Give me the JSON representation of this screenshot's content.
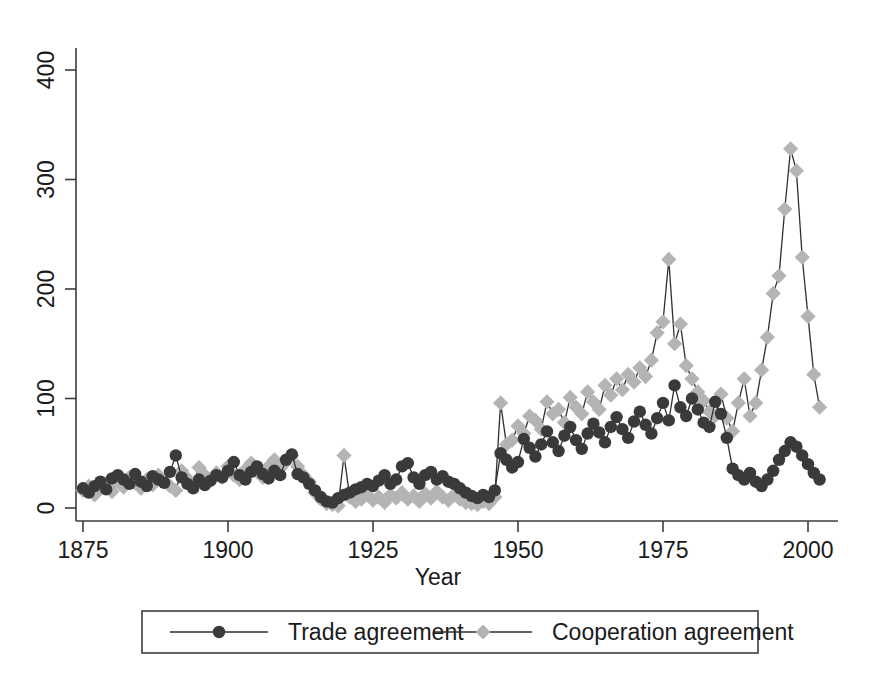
{
  "chart_data": {
    "type": "line",
    "title": "",
    "subtitle": "",
    "xlabel": "Year",
    "ylabel": "",
    "xlim": [
      1873,
      2004
    ],
    "ylim": [
      0,
      420
    ],
    "xticks": [
      1875,
      1900,
      1925,
      1950,
      1975,
      2000
    ],
    "xtick_labels": [
      "1875",
      "1900",
      "1925",
      "1950",
      "1975",
      "2000"
    ],
    "yticks": [
      0,
      100,
      200,
      300,
      400
    ],
    "ytick_labels": [
      "0",
      "100",
      "200",
      "300",
      "400"
    ],
    "grid": false,
    "legend_position": "bottom-outside",
    "colors": {
      "trade_marker": "#3a3a3a",
      "cooperation_marker": "#b4b4b4",
      "line": "#2f2f2f",
      "axis": "#3c3c3c",
      "background": "#ffffff",
      "text": "#1a1a1a"
    },
    "markers": {
      "trade": "circle",
      "cooperation": "diamond"
    },
    "x": [
      1875,
      1876,
      1877,
      1878,
      1879,
      1880,
      1881,
      1882,
      1883,
      1884,
      1885,
      1886,
      1887,
      1888,
      1889,
      1890,
      1891,
      1892,
      1893,
      1894,
      1895,
      1896,
      1897,
      1898,
      1899,
      1900,
      1901,
      1902,
      1903,
      1904,
      1905,
      1906,
      1907,
      1908,
      1909,
      1910,
      1911,
      1912,
      1913,
      1914,
      1915,
      1916,
      1917,
      1918,
      1919,
      1920,
      1921,
      1922,
      1923,
      1924,
      1925,
      1926,
      1927,
      1928,
      1929,
      1930,
      1931,
      1932,
      1933,
      1934,
      1935,
      1936,
      1937,
      1938,
      1939,
      1940,
      1941,
      1942,
      1943,
      1944,
      1945,
      1946,
      1947,
      1948,
      1949,
      1950,
      1951,
      1952,
      1953,
      1954,
      1955,
      1956,
      1957,
      1958,
      1959,
      1960,
      1961,
      1962,
      1963,
      1964,
      1965,
      1966,
      1967,
      1968,
      1969,
      1970,
      1971,
      1972,
      1973,
      1974,
      1975,
      1976,
      1977,
      1978,
      1979,
      1980,
      1981,
      1982,
      1983,
      1984,
      1985,
      1986,
      1987,
      1988,
      1989,
      1990,
      1991,
      1992,
      1993,
      1994,
      1995,
      1996,
      1997,
      1998,
      1999,
      2000,
      2001,
      2002
    ],
    "series": [
      {
        "name": "Trade agreement",
        "marker": "circle",
        "color": "#3a3a3a",
        "values": [
          18,
          14,
          20,
          24,
          17,
          27,
          30,
          26,
          22,
          31,
          24,
          20,
          29,
          26,
          23,
          33,
          48,
          28,
          22,
          18,
          26,
          21,
          25,
          30,
          28,
          34,
          42,
          30,
          26,
          33,
          38,
          31,
          27,
          34,
          30,
          44,
          49,
          31,
          28,
          22,
          16,
          10,
          6,
          5,
          9,
          12,
          14,
          17,
          19,
          22,
          20,
          25,
          30,
          22,
          26,
          38,
          41,
          28,
          22,
          30,
          33,
          26,
          29,
          24,
          22,
          18,
          14,
          11,
          9,
          12,
          10,
          16,
          50,
          44,
          37,
          42,
          63,
          55,
          47,
          58,
          70,
          60,
          52,
          66,
          74,
          62,
          54,
          68,
          77,
          69,
          60,
          74,
          83,
          72,
          64,
          79,
          88,
          76,
          68,
          82,
          96,
          80,
          112,
          92,
          84,
          100,
          90,
          78,
          74,
          97,
          86,
          64,
          36,
          30,
          26,
          32,
          24,
          20,
          26,
          34,
          44,
          52,
          60,
          56,
          48,
          40,
          32,
          26
        ]
      },
      {
        "name": "Cooperation agreement",
        "marker": "diamond",
        "color": "#b4b4b4",
        "values": [
          16,
          20,
          12,
          18,
          22,
          15,
          24,
          19,
          28,
          23,
          18,
          26,
          21,
          30,
          25,
          20,
          16,
          34,
          27,
          22,
          37,
          30,
          25,
          32,
          28,
          38,
          30,
          26,
          35,
          41,
          33,
          28,
          38,
          44,
          36,
          42,
          48,
          38,
          30,
          24,
          14,
          8,
          4,
          3,
          2,
          48,
          10,
          6,
          8,
          12,
          7,
          10,
          5,
          12,
          9,
          14,
          8,
          11,
          6,
          13,
          9,
          15,
          10,
          7,
          12,
          8,
          5,
          4,
          3,
          6,
          4,
          10,
          96,
          58,
          62,
          75,
          68,
          84,
          80,
          72,
          97,
          86,
          90,
          78,
          101,
          92,
          86,
          106,
          97,
          90,
          112,
          103,
          118,
          108,
          122,
          115,
          128,
          120,
          135,
          160,
          170,
          227,
          150,
          168,
          130,
          118,
          106,
          98,
          88,
          84,
          104,
          82,
          70,
          96,
          118,
          84,
          96,
          126,
          156,
          196,
          212,
          273,
          328,
          308,
          229,
          175,
          122,
          92
        ]
      }
    ],
    "annotations": [
      {
        "text": "Post-1945 sharp increase in both series"
      },
      {
        "text": "Cooperation agreement peak 1976 at ~227"
      },
      {
        "text": "Cooperation agreement maximum 1997 at ~328"
      }
    ]
  },
  "legend": {
    "items": [
      {
        "label": "Trade agreement",
        "marker": "circle",
        "color": "#3a3a3a"
      },
      {
        "label": "Cooperation agreement",
        "marker": "diamond",
        "color": "#b4b4b4"
      }
    ]
  },
  "axis": {
    "x_title": "Year"
  }
}
